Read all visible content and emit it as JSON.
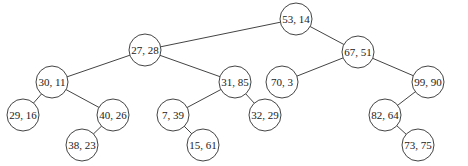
{
  "diagram": {
    "type": "kd-tree",
    "node_radius": 16,
    "nodes": [
      {
        "id": "n53_14",
        "label": "53, 14",
        "x": 296,
        "y": 19
      },
      {
        "id": "n27_28",
        "label": "27, 28",
        "x": 145,
        "y": 50
      },
      {
        "id": "n67_51",
        "label": "67, 51",
        "x": 358,
        "y": 52
      },
      {
        "id": "n30_11",
        "label": "30, 11",
        "x": 52,
        "y": 82
      },
      {
        "id": "n31_85",
        "label": "31, 85",
        "x": 235,
        "y": 82
      },
      {
        "id": "n70_3",
        "label": "70, 3",
        "x": 282,
        "y": 82
      },
      {
        "id": "n99_90",
        "label": "99, 90",
        "x": 428,
        "y": 82
      },
      {
        "id": "n29_16",
        "label": "29, 16",
        "x": 23,
        "y": 115
      },
      {
        "id": "n40_26",
        "label": "40, 26",
        "x": 113,
        "y": 115
      },
      {
        "id": "n7_39",
        "label": "7, 39",
        "x": 173,
        "y": 115
      },
      {
        "id": "n32_29",
        "label": "32, 29",
        "x": 265,
        "y": 115
      },
      {
        "id": "n82_64",
        "label": "82, 64",
        "x": 385,
        "y": 115
      },
      {
        "id": "n38_23",
        "label": "38, 23",
        "x": 82,
        "y": 145
      },
      {
        "id": "n15_61",
        "label": "15, 61",
        "x": 203,
        "y": 145
      },
      {
        "id": "n73_75",
        "label": "73, 75",
        "x": 418,
        "y": 145
      }
    ],
    "edges": [
      [
        "n53_14",
        "n27_28"
      ],
      [
        "n53_14",
        "n67_51"
      ],
      [
        "n27_28",
        "n30_11"
      ],
      [
        "n27_28",
        "n31_85"
      ],
      [
        "n67_51",
        "n70_3"
      ],
      [
        "n67_51",
        "n99_90"
      ],
      [
        "n30_11",
        "n29_16"
      ],
      [
        "n30_11",
        "n40_26"
      ],
      [
        "n31_85",
        "n7_39"
      ],
      [
        "n31_85",
        "n32_29"
      ],
      [
        "n99_90",
        "n82_64"
      ],
      [
        "n40_26",
        "n38_23"
      ],
      [
        "n7_39",
        "n15_61"
      ],
      [
        "n82_64",
        "n73_75"
      ]
    ]
  }
}
